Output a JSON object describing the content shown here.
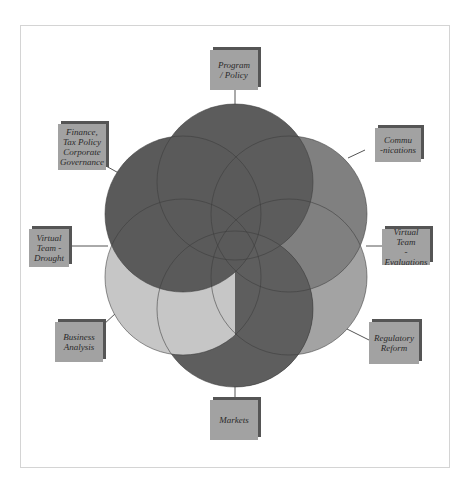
{
  "diagram": {
    "type": "overlapping-circles-flower",
    "center": [
      235,
      246
    ],
    "circle_radius": 78,
    "colors": {
      "dark": "#5e5e5e",
      "medium": "#7e7e7e",
      "light_medium": "#a0a0a0",
      "light": "#c4c4c4",
      "outline": "#3c3c3c",
      "box_fill": "#a2a2a2",
      "box_shadow": "#555555",
      "connector": "#555555",
      "frame": "#d4d4d4"
    },
    "circles": [
      {
        "name": "top",
        "cx": 235,
        "cy": 182,
        "fill": "#5c5c5c"
      },
      {
        "name": "upper-right",
        "cx": 289,
        "cy": 214,
        "fill": "#808080"
      },
      {
        "name": "lower-right",
        "cx": 289,
        "cy": 277,
        "fill": "#a3a3a3"
      },
      {
        "name": "bottom",
        "cx": 235,
        "cy": 309,
        "fill": "#5e5e5e"
      },
      {
        "name": "lower-left",
        "cx": 183,
        "cy": 277,
        "fill": "#c6c6c6"
      },
      {
        "name": "upper-left",
        "cx": 183,
        "cy": 214,
        "fill": "#5a5a5a"
      }
    ],
    "labels": [
      {
        "id": "program-policy",
        "text": "Program\n/ Policy",
        "x": 210,
        "y": 50,
        "w": 48,
        "h": 40,
        "line": [
          235,
          90,
          235,
          104
        ]
      },
      {
        "id": "communications",
        "text": "Commu\n-nications",
        "x": 375,
        "y": 128,
        "w": 46,
        "h": 34,
        "line": [
          365,
          150,
          348,
          158
        ]
      },
      {
        "id": "virtual-team-evaluations",
        "text": "Virtual Team\n- Evaluations",
        "x": 382,
        "y": 229,
        "w": 48,
        "h": 36,
        "line": [
          366,
          246,
          382,
          246
        ]
      },
      {
        "id": "regulatory-reform",
        "text": "Regulatory\nReform",
        "x": 369,
        "y": 322,
        "w": 50,
        "h": 42,
        "line": [
          347,
          329,
          369,
          340
        ]
      },
      {
        "id": "markets",
        "text": "Markets",
        "x": 210,
        "y": 400,
        "w": 48,
        "h": 40,
        "line": [
          235,
          387,
          235,
          400
        ]
      },
      {
        "id": "business-analysis",
        "text": "Business\nAnalysis",
        "x": 55,
        "y": 322,
        "w": 48,
        "h": 40,
        "line": [
          103,
          325,
          116,
          313
        ]
      },
      {
        "id": "virtual-team-drought",
        "text": "Virtual\nTeam -\nDrought",
        "x": 29,
        "y": 229,
        "w": 40,
        "h": 38,
        "line": [
          69,
          246,
          108,
          246
        ]
      },
      {
        "id": "finance-tax-policy",
        "text": "Finance,\nTax Policy\nCorporate\nGovernance",
        "x": 58,
        "y": 124,
        "w": 48,
        "h": 46,
        "line": [
          106,
          166,
          124,
          176
        ]
      }
    ]
  }
}
